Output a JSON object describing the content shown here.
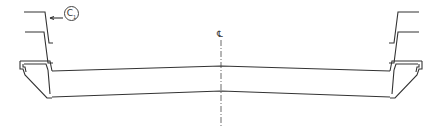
{
  "diagram": {
    "type": "cross-section profile",
    "centerline_label": "℄",
    "callout_label": "C",
    "callout_subscript": "1",
    "colors": {
      "line": "#333333",
      "background": "#ffffff"
    }
  }
}
